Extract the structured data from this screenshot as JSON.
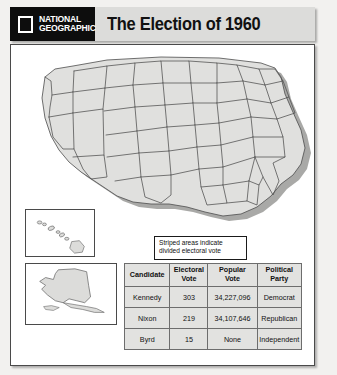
{
  "header": {
    "logo_line1": "NATIONAL",
    "logo_line2": "GEOGRAPHIC",
    "logo_icon": "national-geographic-rectangle-icon",
    "title": "The Election of 1960"
  },
  "map": {
    "name": "united-states-electoral-map-1960",
    "fill_color": "#e0e0de",
    "stroke_color": "#4d4d4d",
    "shadow_color": "#a8a8a6",
    "insets": [
      {
        "name": "hawaii-inset",
        "label": "Hawaii"
      },
      {
        "name": "alaska-inset",
        "label": "Alaska"
      }
    ]
  },
  "legend": {
    "line1": "Striped areas indicate",
    "line2": "divided electoral vote"
  },
  "table": {
    "headers": [
      "Candidate",
      "Electoral\nVote",
      "Popular\nVote",
      "Political\nParty"
    ],
    "headers_split": [
      {
        "top": "Candidate",
        "bottom": ""
      },
      {
        "top": "Electoral",
        "bottom": "Vote"
      },
      {
        "top": "Popular",
        "bottom": "Vote"
      },
      {
        "top": "Political",
        "bottom": "Party"
      }
    ],
    "rows": [
      {
        "candidate": "Kennedy",
        "electoral_vote": "303",
        "popular_vote": "34,227,096",
        "party": "Democrat"
      },
      {
        "candidate": "Nixon",
        "electoral_vote": "219",
        "popular_vote": "34,107,646",
        "party": "Republican"
      },
      {
        "candidate": "Byrd",
        "electoral_vote": "15",
        "popular_vote": "None",
        "party": "Independent"
      }
    ]
  }
}
